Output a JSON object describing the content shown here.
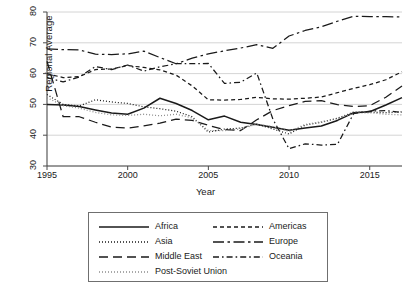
{
  "chart_data": {
    "type": "line",
    "title": "",
    "xlabel": "Year",
    "ylabel": "Regional Average",
    "xlim": [
      1995,
      2017
    ],
    "ylim": [
      30,
      80
    ],
    "yticks": [
      30,
      40,
      50,
      60,
      70,
      80
    ],
    "xticks": [
      1995,
      2000,
      2005,
      2010,
      2015
    ],
    "grid": "horizontal",
    "legend_position": "bottom",
    "x": [
      1995,
      1996,
      1997,
      1998,
      1999,
      2000,
      2001,
      2002,
      2003,
      2004,
      2005,
      2006,
      2007,
      2008,
      2009,
      2010,
      2011,
      2012,
      2013,
      2014,
      2015,
      2016,
      2017
    ],
    "series": [
      {
        "name": "Africa",
        "style": "solid",
        "values": [
          50.0,
          49.8,
          49.3,
          48.2,
          47.2,
          46.8,
          48.8,
          52.0,
          50.3,
          48.0,
          45.0,
          46.2,
          44.2,
          43.5,
          42.6,
          41.6,
          42.3,
          43.0,
          44.8,
          47.3,
          47.6,
          49.8,
          52.2
        ]
      },
      {
        "name": "Asia",
        "style": "dotted",
        "values": [
          53.2,
          50.0,
          49.5,
          51.5,
          50.8,
          50.3,
          49.2,
          48.6,
          47.8,
          46.0,
          41.0,
          42.0,
          42.3,
          43.6,
          42.0,
          40.4,
          43.3,
          44.2,
          45.5,
          47.5,
          47.5,
          47.3,
          47.6
        ]
      },
      {
        "name": "Middle East",
        "style": "long-dash",
        "values": [
          64.0,
          46.0,
          46.0,
          44.2,
          42.6,
          42.3,
          43.0,
          43.9,
          45.2,
          44.8,
          43.2,
          41.8,
          41.5,
          45.0,
          48.0,
          49.6,
          51.0,
          51.2,
          49.9,
          49.3,
          49.6,
          52.3,
          56.0
        ]
      },
      {
        "name": "Post-Soviet Union",
        "style": "dotted-light",
        "values": [
          52.2,
          49.6,
          48.8,
          47.4,
          46.6,
          46.4,
          46.8,
          46.3,
          46.8,
          45.6,
          41.5,
          41.5,
          42.0,
          43.6,
          42.8,
          41.2,
          43.5,
          44.4,
          45.3,
          47.2,
          47.3,
          46.8,
          46.6
        ]
      },
      {
        "name": "Americas",
        "style": "short-dash",
        "values": [
          60.0,
          58.7,
          59.0,
          61.3,
          61.5,
          62.6,
          62.0,
          61.2,
          59.5,
          56.0,
          51.5,
          51.4,
          51.6,
          52.3,
          51.8,
          51.7,
          52.0,
          52.4,
          53.8,
          55.2,
          56.4,
          58.0,
          60.6
        ]
      },
      {
        "name": "Europe",
        "style": "long-dash-dot",
        "values": [
          68.0,
          67.8,
          67.7,
          66.3,
          66.2,
          66.4,
          67.3,
          65.2,
          63.2,
          65.0,
          66.4,
          67.4,
          68.3,
          69.4,
          68.2,
          72.2,
          74.0,
          75.2,
          77.0,
          78.6,
          78.5,
          78.5,
          78.4
        ]
      },
      {
        "name": "Oceania",
        "style": "dash-dot",
        "values": [
          58.7,
          57.3,
          58.9,
          62.3,
          61.3,
          62.8,
          60.8,
          62.2,
          63.2,
          63.2,
          63.3,
          56.8,
          57.2,
          60.2,
          45.2,
          35.6,
          37.2,
          36.8,
          37.0,
          47.0,
          47.8,
          48.0,
          47.4
        ]
      }
    ]
  },
  "legend": {
    "entries": [
      {
        "label": "Africa"
      },
      {
        "label": "Asia"
      },
      {
        "label": "Middle East"
      },
      {
        "label": "Post-Soviet Union"
      },
      {
        "label": "Americas"
      },
      {
        "label": "Europe"
      },
      {
        "label": "Oceania"
      }
    ]
  },
  "colors": {
    "line": "#1a1a1a",
    "light_line": "#8d8d8d",
    "grid": "#c9c9c9",
    "axis": "#4a4a4a"
  }
}
